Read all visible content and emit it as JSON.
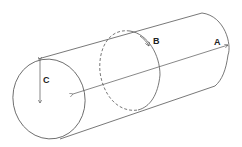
{
  "diagram": {
    "labels": {
      "a": "A",
      "b": "B",
      "c": "C"
    },
    "colors": {
      "stroke": "#555555",
      "background": "#ffffff",
      "label": "#222222"
    }
  }
}
